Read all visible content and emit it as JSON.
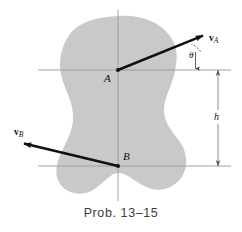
{
  "figure": {
    "caption": "Prob. 13–15",
    "colors": {
      "body_fill": "#c9c9c9",
      "axis_line": "#9a9a9a",
      "vector": "#111111",
      "dimension_line": "#6f6f6f",
      "background": "#ffffff",
      "label_text": "#111111",
      "caption_text": "#3c3c3c"
    },
    "points": [
      {
        "id": "A",
        "label": "A",
        "x": 118,
        "y": 70
      },
      {
        "id": "B",
        "label": "B",
        "x": 118,
        "y": 166
      }
    ],
    "vectors": [
      {
        "id": "vA",
        "label": "v",
        "subscript": "A",
        "from": {
          "x": 118,
          "y": 70
        },
        "to": {
          "x": 205,
          "y": 35
        },
        "description": "velocity of point A directed up and to the right"
      },
      {
        "id": "vB",
        "label": "v",
        "subscript": "B",
        "from": {
          "x": 118,
          "y": 166
        },
        "to": {
          "x": 22,
          "y": 143
        },
        "description": "velocity of point B directed up and to the left"
      }
    ],
    "angle": {
      "symbol": "θ",
      "vertex": {
        "x": 205,
        "y": 35
      },
      "between": "vA and horizontal reference line"
    },
    "dimension": {
      "symbol": "h",
      "orientation": "vertical",
      "x": 218,
      "from_y": 70,
      "to_y": 166,
      "description": "vertical distance between A and B"
    },
    "reference_lines": [
      {
        "id": "axis-vertical",
        "x1": 118,
        "y1": 10,
        "x2": 118,
        "y2": 201
      },
      {
        "id": "axis-horizontal-top",
        "x1": 38,
        "y1": 70,
        "x2": 231,
        "y2": 70
      },
      {
        "id": "axis-horizontal-bottom",
        "x1": 38,
        "y1": 166,
        "x2": 231,
        "y2": 166
      }
    ],
    "body": {
      "name": "rigid-body-blob",
      "description": "irregular gray kidney-shaped rigid body"
    }
  }
}
